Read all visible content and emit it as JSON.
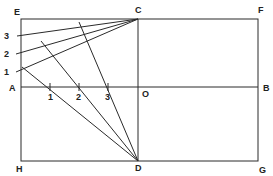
{
  "diagram": {
    "points": {
      "E": {
        "label": "E"
      },
      "C": {
        "label": "C"
      },
      "F": {
        "label": "F"
      },
      "A": {
        "label": "A"
      },
      "O": {
        "label": "O"
      },
      "B": {
        "label": "B"
      },
      "H": {
        "label": "H"
      },
      "D": {
        "label": "D"
      },
      "G": {
        "label": "G"
      }
    },
    "left_marks": [
      "3",
      "2",
      "1"
    ],
    "axis_ticks": [
      "1",
      "2",
      "3"
    ],
    "stroke_color": "#2a2a2a"
  }
}
